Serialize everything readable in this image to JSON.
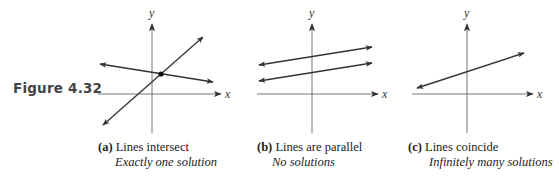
{
  "figure": {
    "label": "Figure 4.32"
  },
  "panels": [
    {
      "id": "a",
      "tag": "(a)",
      "title": "Lines intersect",
      "subtitle": "Exactly one solution",
      "axis_x_label": "x",
      "axis_y_label": "y",
      "origin": [
        152,
        94
      ],
      "lines": [
        {
          "from": [
            103,
            125
          ],
          "to": [
            203,
            37
          ]
        },
        {
          "from": [
            100,
            64
          ],
          "to": [
            213,
            82
          ]
        }
      ],
      "intersection_point": [
        161,
        74
      ]
    },
    {
      "id": "b",
      "tag": "(b)",
      "title": "Lines are parallel",
      "subtitle": "No solutions",
      "axis_x_label": "x",
      "axis_y_label": "y",
      "origin": [
        312,
        94
      ],
      "lines": [
        {
          "from": [
            259,
            65
          ],
          "to": [
            372,
            47
          ]
        },
        {
          "from": [
            259,
            81
          ],
          "to": [
            372,
            63
          ]
        }
      ]
    },
    {
      "id": "c",
      "tag": "(c)",
      "title": "Lines coincide",
      "subtitle": "Infinitely many solutions",
      "axis_x_label": "x",
      "axis_y_label": "y",
      "origin": [
        467,
        94
      ],
      "lines": [
        {
          "from": [
            417,
            88
          ],
          "to": [
            524,
            53
          ]
        }
      ]
    }
  ],
  "colors": {
    "axis": "#555555",
    "line": "#333333",
    "text": "#222222"
  }
}
